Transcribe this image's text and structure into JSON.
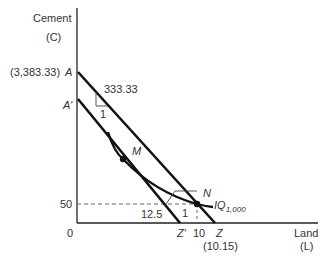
{
  "axes": {
    "y_label_line1": "Cement",
    "y_label_line2": "(C)",
    "x_label_line1": "Land",
    "x_label_line2": "(L)",
    "origin": "0"
  },
  "points": {
    "A": "A",
    "A_value": "(3,383.33)",
    "A_prime": "A′",
    "M": "M",
    "N": "N",
    "Z": "Z",
    "Z_value": "(10.15)",
    "Z_prime": "Z′",
    "ten": "10"
  },
  "ticks": {
    "y_50": "50"
  },
  "slopes": {
    "upper_rise": "333.33",
    "upper_run": "1",
    "lower_rise": "12.5",
    "lower_run": "1"
  },
  "isoquant": {
    "label": "IQ",
    "subscript": "1,000"
  },
  "colors": {
    "line": "#111111",
    "text": "#333333",
    "dashed": "#555555"
  }
}
